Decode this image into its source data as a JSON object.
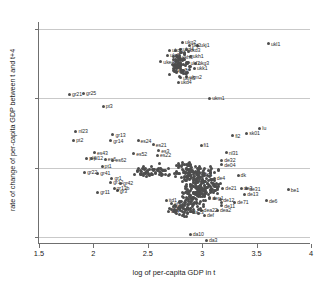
{
  "chart_data": {
    "type": "scatter",
    "title": "",
    "xlabel": "log of per-capita GDP in t",
    "ylabel": "rate of change of per-capita GDP between t and t+4",
    "xlim": [
      1.5,
      4.0
    ],
    "ylim": [
      -0.02,
      0.62
    ],
    "xticks": [
      "1.5",
      "2",
      "2.5",
      "3",
      "3.5",
      "4"
    ],
    "xtick_values": [
      1.5,
      2,
      2.5,
      3,
      3.5,
      4
    ],
    "yticks": [
      "0",
      ".2",
      ".4",
      ".6"
    ],
    "ytick_values": [
      0,
      0.2,
      0.4,
      0.6
    ],
    "grid": "horizontal",
    "legend": "none",
    "marker_color": "#4d4d4d",
    "axis_color": "#6f6f6f",
    "grid_color": "#c9c9c9",
    "background_color": "#ffffff",
    "points": [
      {
        "label": "ukl1",
        "x": 3.61,
        "y": 0.557
      },
      {
        "label": "ukg2",
        "x": 2.82,
        "y": 0.561
      },
      {
        "label": "ukj1",
        "x": 2.96,
        "y": 0.553
      },
      {
        "label": "ukj2",
        "x": 2.88,
        "y": 0.552
      },
      {
        "label": "ukd4",
        "x": 2.8,
        "y": 0.541
      },
      {
        "label": "ukd3",
        "x": 2.86,
        "y": 0.54
      },
      {
        "label": "ukd6",
        "x": 2.7,
        "y": 0.538
      },
      {
        "label": "ukd5",
        "x": 2.68,
        "y": 0.524
      },
      {
        "label": "ukh1",
        "x": 2.89,
        "y": 0.521
      },
      {
        "label": "ukh3",
        "x": 2.79,
        "y": 0.519
      },
      {
        "label": "uke4",
        "x": 2.62,
        "y": 0.505
      },
      {
        "label": "ukf2",
        "x": 2.87,
        "y": 0.502
      },
      {
        "label": "ukg3",
        "x": 2.94,
        "y": 0.5
      },
      {
        "label": "ukk1",
        "x": 2.93,
        "y": 0.487
      },
      {
        "label": "uke2",
        "x": 2.74,
        "y": 0.481
      },
      {
        "label": "ukj3",
        "x": 2.76,
        "y": 0.477
      },
      {
        "label": "ukm2",
        "x": 2.86,
        "y": 0.462
      },
      {
        "label": "ukm3",
        "x": 2.8,
        "y": 0.459
      },
      {
        "label": "ukd4",
        "x": 2.78,
        "y": 0.446
      },
      {
        "label": "ukm1",
        "x": 3.07,
        "y": 0.399
      },
      {
        "label": "gr21",
        "x": 1.78,
        "y": 0.412
      },
      {
        "label": "gr25",
        "x": 1.91,
        "y": 0.415
      },
      {
        "label": "pt3",
        "x": 2.09,
        "y": 0.376
      },
      {
        "label": "lu",
        "x": 3.53,
        "y": 0.314
      },
      {
        "label": "sk01",
        "x": 3.41,
        "y": 0.3
      },
      {
        "label": "fi2",
        "x": 3.28,
        "y": 0.292
      },
      {
        "label": "nl23",
        "x": 1.84,
        "y": 0.305
      },
      {
        "label": "gr13",
        "x": 2.18,
        "y": 0.295
      },
      {
        "label": "pt2",
        "x": 1.82,
        "y": 0.279
      },
      {
        "label": "gr14",
        "x": 2.16,
        "y": 0.277
      },
      {
        "label": "es24",
        "x": 2.41,
        "y": 0.277
      },
      {
        "label": "es21",
        "x": 2.55,
        "y": 0.266
      },
      {
        "label": "fi1",
        "x": 2.99,
        "y": 0.265
      },
      {
        "label": "nl31",
        "x": 3.22,
        "y": 0.243
      },
      {
        "label": "es43",
        "x": 2.01,
        "y": 0.243
      },
      {
        "label": "es52",
        "x": 2.37,
        "y": 0.24
      },
      {
        "label": "es3",
        "x": 2.6,
        "y": 0.249
      },
      {
        "label": "es22",
        "x": 2.59,
        "y": 0.235
      },
      {
        "label": "pl4",
        "x": 1.94,
        "y": 0.227
      },
      {
        "label": "pl12",
        "x": 1.98,
        "y": 0.226
      },
      {
        "label": "es6",
        "x": 2.11,
        "y": 0.224
      },
      {
        "label": "es62",
        "x": 2.18,
        "y": 0.222
      },
      {
        "label": "de32",
        "x": 3.18,
        "y": 0.222
      },
      {
        "label": "de04",
        "x": 3.18,
        "y": 0.208
      },
      {
        "label": "pt1",
        "x": 2.08,
        "y": 0.203
      },
      {
        "label": "gr22",
        "x": 1.92,
        "y": 0.187
      },
      {
        "label": "gr41",
        "x": 2.04,
        "y": 0.183
      },
      {
        "label": "itc1",
        "x": 3.0,
        "y": 0.181
      },
      {
        "label": "dk",
        "x": 3.33,
        "y": 0.177
      },
      {
        "label": "de4",
        "x": 3.11,
        "y": 0.17
      },
      {
        "label": "gr1",
        "x": 2.17,
        "y": 0.169
      },
      {
        "label": "gr12",
        "x": 2.16,
        "y": 0.158
      },
      {
        "label": "gr42",
        "x": 2.25,
        "y": 0.155
      },
      {
        "label": "nl3",
        "x": 2.94,
        "y": 0.157
      },
      {
        "label": "de3",
        "x": 3.36,
        "y": 0.141
      },
      {
        "label": "de21",
        "x": 3.19,
        "y": 0.141
      },
      {
        "label": "de31",
        "x": 3.41,
        "y": 0.139
      },
      {
        "label": "gr3",
        "x": 2.22,
        "y": 0.133
      },
      {
        "label": "gr13b",
        "x": 2.19,
        "y": 0.14
      },
      {
        "label": "gr11",
        "x": 2.04,
        "y": 0.129
      },
      {
        "label": "be1",
        "x": 3.79,
        "y": 0.136
      },
      {
        "label": "de13",
        "x": 3.39,
        "y": 0.123
      },
      {
        "label": "dep1",
        "x": 3.07,
        "y": 0.113
      },
      {
        "label": "itd1",
        "x": 2.67,
        "y": 0.105
      },
      {
        "label": "de12",
        "x": 3.17,
        "y": 0.107
      },
      {
        "label": "de71",
        "x": 3.3,
        "y": 0.1
      },
      {
        "label": "de6",
        "x": 3.59,
        "y": 0.104
      },
      {
        "label": "itf2",
        "x": 2.72,
        "y": 0.096
      },
      {
        "label": "de11",
        "x": 3.18,
        "y": 0.09
      },
      {
        "label": "itg2",
        "x": 2.7,
        "y": 0.083
      },
      {
        "label": "dea22",
        "x": 2.99,
        "y": 0.078
      },
      {
        "label": "dea2",
        "x": 3.14,
        "y": 0.077
      },
      {
        "label": "def",
        "x": 3.02,
        "y": 0.062
      },
      {
        "label": "ite4",
        "x": 2.69,
        "y": 0.075
      },
      {
        "label": "da23",
        "x": 2.89,
        "y": 0.073
      },
      {
        "label": "da10",
        "x": 2.89,
        "y": 0.007
      },
      {
        "label": "da3",
        "x": 3.04,
        "y": -0.01
      }
    ],
    "cluster_note": "dense unlabeled central cloud of ~300 additional NUTS-region observations"
  }
}
